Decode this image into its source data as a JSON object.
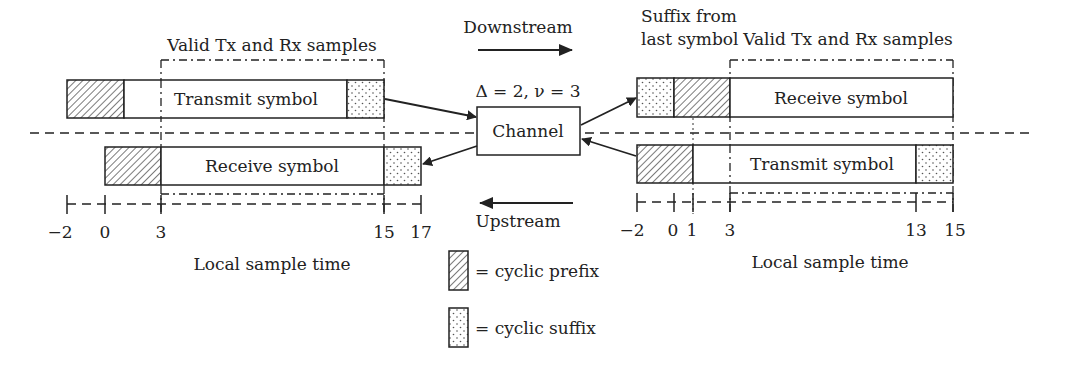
{
  "labels": {
    "valid_left": "Valid Tx and Rx samples",
    "valid_right": "Valid Tx and Rx samples",
    "suffix_note_line1": "Suffix from",
    "suffix_note_line2": "last symbol",
    "downstream": "Downstream",
    "upstream": "Upstream",
    "channel_params": "Δ = 2, ν = 3",
    "channel": "Channel",
    "left_tx": "Transmit symbol",
    "left_rx": "Receive symbol",
    "right_rx": "Receive symbol",
    "right_tx": "Transmit symbol",
    "time_left": "Local sample time",
    "time_right": "Local sample time"
  },
  "ticks_left": [
    "−2",
    "0",
    "3",
    "15",
    "17"
  ],
  "ticks_right": [
    "−2",
    "0",
    "1",
    "3",
    "13",
    "15"
  ],
  "legend": {
    "prefix": "= cyclic prefix",
    "suffix": "= cyclic suffix"
  },
  "colors": {
    "line": "#222222",
    "background": "#ffffff"
  }
}
